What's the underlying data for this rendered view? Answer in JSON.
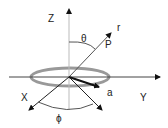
{
  "labels": {
    "z": "Z",
    "r": "r",
    "theta": "θ",
    "p": "P",
    "a": "a",
    "y": "Y",
    "x": "X",
    "phi": "ϕ"
  },
  "colors": {
    "ring": "#999999",
    "axis_light": "#bbbbbb",
    "axis_dark": "#111111"
  }
}
